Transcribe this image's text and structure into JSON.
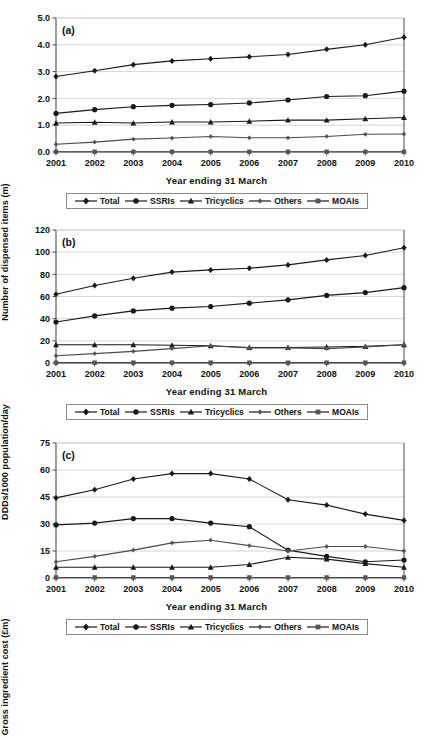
{
  "figure": {
    "width": 433,
    "height": 650,
    "background": "#ffffff",
    "line_color": "#1a1a1a",
    "grid_color": "#d6d6d6",
    "axis_color": "#4d4d4d"
  },
  "xaxis_title": "Year ending 31 March",
  "legend": {
    "items": [
      {
        "label": "Total",
        "marker": "diamond"
      },
      {
        "label": "SSRIs",
        "marker": "circle"
      },
      {
        "label": "Tricyclics",
        "marker": "triangle"
      },
      {
        "label": "Others",
        "marker": "small-diamond"
      },
      {
        "label": "MOAIs",
        "marker": "square"
      }
    ]
  },
  "panels": [
    {
      "tag": "(a)",
      "ylabel": "Number of dispensed items (m)"
    },
    {
      "tag": "(b)",
      "ylabel": "DDDs/1000 population/day"
    },
    {
      "tag": "(c)",
      "ylabel": "Gross ingredient cost (£m)"
    }
  ],
  "chart_data": [
    {
      "type": "line",
      "panel": "(a)",
      "title": "",
      "xlabel": "Year ending 31 March",
      "ylabel": "Number of dispensed items (m)",
      "categories": [
        "2001",
        "2002",
        "2003",
        "2004",
        "2005",
        "2006",
        "2007",
        "2008",
        "2009",
        "2010"
      ],
      "ylim": [
        0.0,
        5.0
      ],
      "yticks": [
        "0.0",
        "1.0",
        "2.0",
        "3.0",
        "4.0",
        "5.0"
      ],
      "ytick_values": [
        0,
        1,
        2,
        3,
        4,
        5
      ],
      "grid": true,
      "legend_position": "below",
      "series": [
        {
          "name": "Total",
          "marker": "diamond",
          "values": [
            2.82,
            3.03,
            3.26,
            3.4,
            3.48,
            3.55,
            3.64,
            3.83,
            4.0,
            4.28
          ]
        },
        {
          "name": "SSRIs",
          "marker": "circle",
          "values": [
            1.44,
            1.58,
            1.69,
            1.74,
            1.77,
            1.83,
            1.94,
            2.07,
            2.1,
            2.27
          ]
        },
        {
          "name": "Tricyclics",
          "marker": "triangle",
          "values": [
            1.08,
            1.11,
            1.08,
            1.12,
            1.12,
            1.15,
            1.19,
            1.19,
            1.24,
            1.29
          ]
        },
        {
          "name": "Others",
          "marker": "small-diamond",
          "values": [
            0.29,
            0.37,
            0.48,
            0.52,
            0.58,
            0.53,
            0.53,
            0.58,
            0.66,
            0.67
          ]
        },
        {
          "name": "MOAIs",
          "marker": "square",
          "values": [
            0.01,
            0.01,
            0.01,
            0.01,
            0.01,
            0.01,
            0.01,
            0.01,
            0.01,
            0.01
          ]
        }
      ]
    },
    {
      "type": "line",
      "panel": "(b)",
      "title": "",
      "xlabel": "Year ending 31 March",
      "ylabel": "DDDs/1000 population/day",
      "categories": [
        "2001",
        "2002",
        "2003",
        "2004",
        "2005",
        "2006",
        "2007",
        "2008",
        "2009",
        "2010"
      ],
      "ylim": [
        0,
        120
      ],
      "yticks": [
        "0",
        "20",
        "40",
        "60",
        "80",
        "100",
        "120"
      ],
      "ytick_values": [
        0,
        20,
        40,
        60,
        80,
        100,
        120
      ],
      "grid": true,
      "legend_position": "below",
      "series": [
        {
          "name": "Total",
          "marker": "diamond",
          "values": [
            62.0,
            70.0,
            76.5,
            82.0,
            84.0,
            85.5,
            88.5,
            93.0,
            97.0,
            104.0
          ]
        },
        {
          "name": "SSRIs",
          "marker": "circle",
          "values": [
            37.0,
            42.5,
            47.0,
            49.5,
            51.0,
            54.0,
            57.0,
            61.0,
            63.5,
            68.0
          ]
        },
        {
          "name": "Tricyclics",
          "marker": "triangle",
          "values": [
            16.5,
            16.5,
            16.5,
            16.0,
            15.5,
            14.0,
            14.0,
            14.5,
            15.0,
            16.5
          ]
        },
        {
          "name": "Others",
          "marker": "small-diamond",
          "values": [
            6.5,
            8.5,
            10.5,
            13.0,
            15.5,
            13.5,
            13.5,
            13.0,
            14.5,
            16.5
          ]
        },
        {
          "name": "MOAIs",
          "marker": "square",
          "values": [
            0.3,
            0.3,
            0.3,
            0.3,
            0.3,
            0.3,
            0.3,
            0.3,
            0.3,
            0.3
          ]
        }
      ]
    },
    {
      "type": "line",
      "panel": "(c)",
      "title": "",
      "xlabel": "Year ending 31 March",
      "ylabel": "Gross ingredient cost (£m)",
      "categories": [
        "2001",
        "2002",
        "2003",
        "2004",
        "2005",
        "2006",
        "2007",
        "2008",
        "2009",
        "2010"
      ],
      "ylim": [
        0,
        75
      ],
      "yticks": [
        "0",
        "15",
        "30",
        "45",
        "60",
        "75"
      ],
      "ytick_values": [
        0,
        15,
        30,
        45,
        60,
        75
      ],
      "grid": true,
      "legend_position": "below",
      "series": [
        {
          "name": "Total",
          "marker": "diamond",
          "values": [
            44.5,
            49.0,
            55.0,
            58.0,
            58.0,
            55.0,
            43.5,
            40.5,
            35.5,
            32.0
          ]
        },
        {
          "name": "SSRIs",
          "marker": "circle",
          "values": [
            29.5,
            30.5,
            33.0,
            33.0,
            30.5,
            28.5,
            15.5,
            12.0,
            9.0,
            10.0
          ]
        },
        {
          "name": "Tricyclics",
          "marker": "triangle",
          "values": [
            6.0,
            6.0,
            6.0,
            6.0,
            6.0,
            7.5,
            11.5,
            10.5,
            8.0,
            6.0
          ]
        },
        {
          "name": "Others",
          "marker": "small-diamond",
          "values": [
            9.0,
            12.0,
            15.5,
            19.5,
            21.0,
            18.0,
            15.0,
            17.5,
            17.5,
            15.0
          ]
        },
        {
          "name": "MOAIs",
          "marker": "square",
          "values": [
            0.3,
            0.3,
            0.3,
            0.3,
            0.3,
            0.3,
            0.3,
            0.3,
            0.3,
            0.3
          ]
        }
      ]
    }
  ]
}
